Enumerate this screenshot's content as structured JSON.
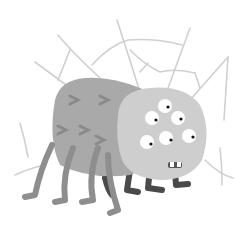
{
  "illustration": {
    "subject": "cartoon spider with six eyes in a web",
    "colors": {
      "background": "#ffffff",
      "web": "#cfcfcf",
      "body": "#a9a9a9",
      "head": "#cecece",
      "legs_front": "#8e8e8e",
      "legs_back": "#4a4a4a",
      "eye_white": "#ffffff",
      "pupil": "#111111",
      "chevron": "#8a8a8a"
    },
    "eye_count": 6
  }
}
